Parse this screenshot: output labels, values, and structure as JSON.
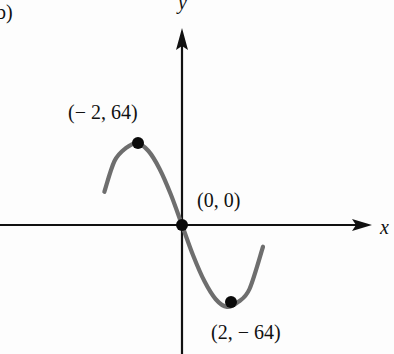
{
  "panel_label": "b)",
  "chart_data": {
    "type": "line",
    "title": "",
    "xlabel": "x",
    "ylabel": "y",
    "function_hint": "cubic with local max and min",
    "grid": false,
    "legend": null,
    "series": [
      {
        "name": "curve",
        "color": "#6e6e6e",
        "x": [
          -3.45,
          -3,
          -2.5,
          -2,
          -1.5,
          -1,
          -0.5,
          0,
          0.5,
          1,
          1.5,
          2,
          2.5,
          3,
          3.6
        ],
        "values": [
          26,
          50,
          60,
          64,
          58,
          44,
          24,
          0,
          -24,
          -44,
          -58,
          -64,
          -60,
          -50,
          -17
        ]
      }
    ],
    "points": [
      {
        "x": -2,
        "y": 64,
        "label": "(−2, 64)"
      },
      {
        "x": 0,
        "y": 0,
        "label": "(0, 0)"
      },
      {
        "x": 2,
        "y": -64,
        "label": "(2, −64)"
      }
    ]
  },
  "labels": {
    "max_point": "(− 2, 64)",
    "origin_point": "(0, 0)",
    "min_point": "(2, − 64)",
    "x_axis": "x",
    "y_axis": "y"
  },
  "colors": {
    "axis": "#111111",
    "curve": "#6e6e6e",
    "point": "#0a0a0a"
  }
}
